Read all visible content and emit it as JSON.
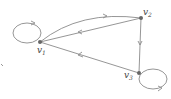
{
  "diagram": {
    "type": "directed-graph",
    "nodes": [
      {
        "id": "v1",
        "label": "v",
        "sub": "1"
      },
      {
        "id": "v2",
        "label": "v",
        "sub": "2"
      },
      {
        "id": "v3",
        "label": "v",
        "sub": "3"
      }
    ],
    "edges": [
      {
        "from": "v1",
        "to": "v1",
        "kind": "self-loop"
      },
      {
        "from": "v1",
        "to": "v2",
        "kind": "curved"
      },
      {
        "from": "v2",
        "to": "v1",
        "kind": "straight"
      },
      {
        "from": "v2",
        "to": "v3",
        "kind": "straight"
      },
      {
        "from": "v3",
        "to": "v1",
        "kind": "straight"
      },
      {
        "from": "v3",
        "to": "v3",
        "kind": "self-loop"
      }
    ],
    "colors": {
      "edge": "#8a8a8a",
      "node": "#666666",
      "label": "#444444"
    }
  }
}
